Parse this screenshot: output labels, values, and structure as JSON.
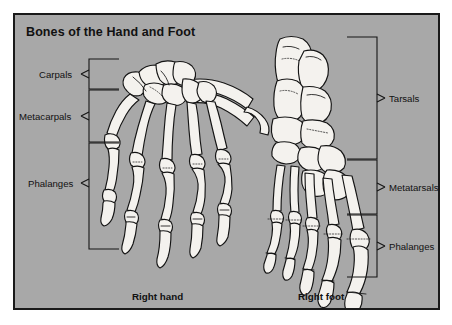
{
  "figure": {
    "title": "Bones of the Hand and Foot",
    "background_color": "#a8a8a8",
    "border_color": "#1a1a1a",
    "bone_fill": "#f2f0ec",
    "bone_outline": "#151515"
  },
  "hand": {
    "caption": "Right hand",
    "labels": [
      {
        "id": "carpals",
        "text": "Carpals"
      },
      {
        "id": "metacarpals",
        "text": "Metacarpals"
      },
      {
        "id": "phalanges",
        "text": "Phalanges"
      }
    ]
  },
  "foot": {
    "caption": "Right foot",
    "labels": [
      {
        "id": "tarsals",
        "text": "Tarsals"
      },
      {
        "id": "metatarsals",
        "text": "Metatarsals"
      },
      {
        "id": "phalanges",
        "text": "Phalanges"
      }
    ]
  }
}
